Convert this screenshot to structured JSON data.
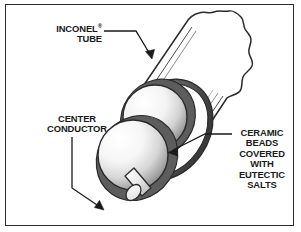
{
  "figure": {
    "kind": "technical-cutaway-illustration",
    "background_color": "#ffffff",
    "frame_color": "#2b2b2b",
    "text_color": "#1a1a1a"
  },
  "labels": {
    "inconel": {
      "line1": "INCONEL",
      "trademark": "®",
      "line2": "TUBE"
    },
    "center_conductor": {
      "line1": "CENTER",
      "line2": "CONDUCTOR"
    },
    "ceramic_beads": {
      "line1": "CERAMIC",
      "line2": "BEADS",
      "line3": "COVERED",
      "line4": "WITH",
      "line5": "EUTECTIC",
      "line6": "SALTS"
    }
  },
  "parts": {
    "tube": {
      "name": "Inconel tube",
      "outline_color": "#2b2b2b",
      "fill_color": "#ffffff",
      "wall_shading": "#6f6f6f"
    },
    "beads": {
      "name": "Ceramic beads covered with eutectic salts",
      "count": 2,
      "highlight_color": "#ffffff",
      "shadow_color": "#7b7b7b",
      "outline_color": "#2b2b2b"
    },
    "conductor": {
      "name": "Center conductor rod",
      "fill_color": "#f2f2f2",
      "shadow_color": "#9a9a9a",
      "outline_color": "#2b2b2b"
    }
  },
  "leaders": {
    "inconel_arrow": "points down-right to tube wall",
    "center_conductor_arrow": "points down-right to conductor rod tip",
    "ceramic_arrow": "points down-left to ceramic bead"
  }
}
